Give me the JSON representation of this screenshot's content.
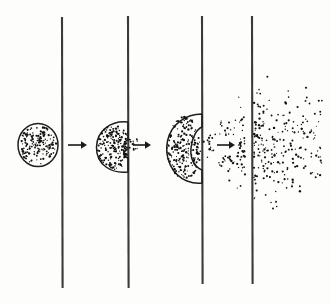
{
  "figure": {
    "title": "Permeation of a stippled mass through a membrane",
    "background_color": "#fdfdfb",
    "ink_color": "#1e1e1e",
    "membrane_color": "#3a3a3a",
    "dot_color": "#111111",
    "canvas": {
      "width": 331,
      "height": 304
    }
  },
  "membranes": [
    {
      "name": "membrane-1",
      "x": 62,
      "y_top": 17,
      "y_bottom": 288
    },
    {
      "name": "membrane-2",
      "x": 128,
      "y_top": 16,
      "y_bottom": 288
    },
    {
      "name": "membrane-3",
      "x": 202,
      "y_top": 16,
      "y_bottom": 284
    },
    {
      "name": "membrane-4",
      "x": 252,
      "y_top": 16,
      "y_bottom": 284
    }
  ],
  "arrows": [
    {
      "name": "arrow-stage-1",
      "x1": 68,
      "x2": 86,
      "y": 145
    },
    {
      "name": "arrow-stage-2",
      "x1": 132,
      "x2": 150,
      "y": 145
    },
    {
      "name": "arrow-stage-3",
      "x1": 217,
      "x2": 234,
      "y": 145
    }
  ],
  "stages": [
    {
      "name": "stage-1-intact-mass",
      "label": "intact round mass left of membrane",
      "shape": "circle",
      "cx": 38,
      "cy": 145,
      "rx": 20,
      "ry": 21,
      "dot_count": 170
    },
    {
      "name": "stage-2-pressed-mass",
      "label": "mass flattened against membrane with small breach",
      "shape": "ellipse-flattened",
      "cx": 114,
      "cy": 147,
      "rx": 18,
      "ry": 25,
      "dot_count": 185,
      "escaping_dot_count": 14
    },
    {
      "name": "stage-3-bulging-mass",
      "label": "mass bulging through membrane, dots streaming right",
      "shape": "lobe",
      "cx": 184,
      "cy": 148,
      "rx": 18,
      "ry": 34,
      "dot_count": 210,
      "plume_dot_count": 120
    },
    {
      "name": "stage-4-dispersed-cloud",
      "label": "fully dispersed cloud right of membrane",
      "shape": "cloud",
      "x_start": 254,
      "x_end": 322,
      "y_top": 62,
      "y_bottom": 222,
      "dot_count": 230
    }
  ]
}
